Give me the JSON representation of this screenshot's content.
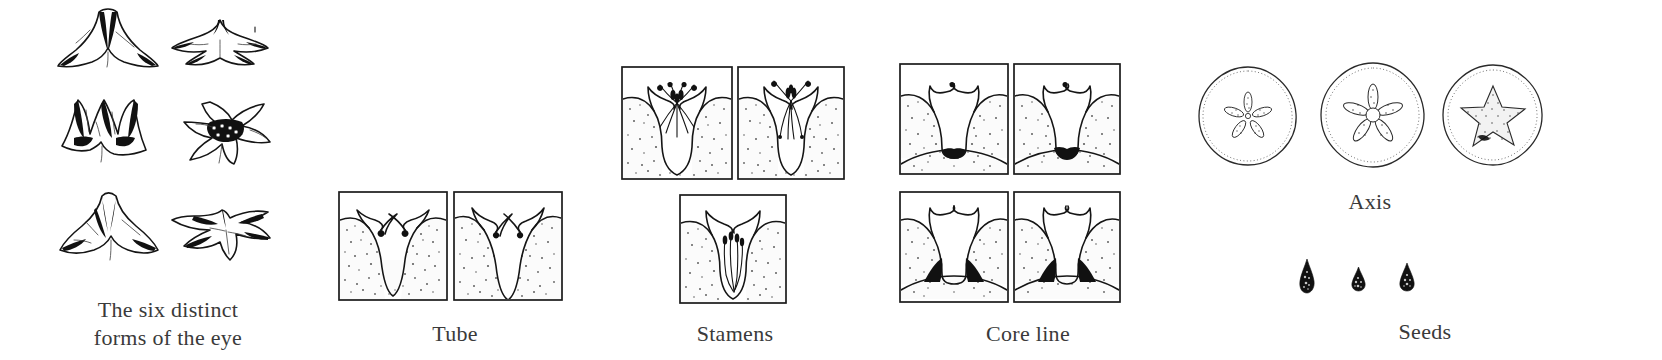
{
  "plate": {
    "title": "Flower morphology comparison plate",
    "background": "#ffffff",
    "ink_color": "#151515",
    "width": 1662,
    "height": 360
  },
  "groups": [
    {
      "id": "eye-forms",
      "caption": "The six distinct\nforms of the eye",
      "caption_x": 68,
      "caption_y": 296,
      "caption_width": 200,
      "figure_kind": "flower-sketch",
      "count": 6,
      "items": [
        {
          "label": "eye-form-1",
          "x": 52,
          "y": 6,
          "w": 110,
          "h": 70,
          "view": "side",
          "variant": "flared-trumpet"
        },
        {
          "label": "eye-form-2",
          "x": 168,
          "y": 14,
          "w": 105,
          "h": 58,
          "view": "front",
          "variant": "flat-spread"
        },
        {
          "label": "eye-form-3",
          "x": 56,
          "y": 88,
          "w": 106,
          "h": 76,
          "view": "side",
          "variant": "spiked-dark-throat"
        },
        {
          "label": "eye-form-4",
          "x": 172,
          "y": 100,
          "w": 104,
          "h": 64,
          "view": "front",
          "variant": "dark-center-rosette"
        },
        {
          "label": "eye-form-5",
          "x": 56,
          "y": 192,
          "w": 108,
          "h": 72,
          "view": "side",
          "variant": "folded-cone"
        },
        {
          "label": "eye-form-6",
          "x": 170,
          "y": 200,
          "w": 106,
          "h": 62,
          "view": "front",
          "variant": "narrow-rays"
        }
      ]
    },
    {
      "id": "tube",
      "caption": "Tube",
      "caption_x": 380,
      "caption_y": 320,
      "caption_width": 150,
      "figure_kind": "section-panel",
      "count": 2,
      "items": [
        {
          "label": "tube-panel-1",
          "x": 337,
          "y": 190,
          "w": 110,
          "h": 110,
          "variant": "narrow-v",
          "core": "none"
        },
        {
          "label": "tube-panel-2",
          "x": 452,
          "y": 190,
          "w": 110,
          "h": 110,
          "variant": "deeper-v",
          "core": "none"
        }
      ]
    },
    {
      "id": "stamens",
      "caption": "Stamens",
      "caption_x": 655,
      "caption_y": 320,
      "caption_width": 160,
      "figure_kind": "section-panel",
      "count": 3,
      "items": [
        {
          "label": "stamens-panel-1",
          "x": 620,
          "y": 65,
          "w": 112,
          "h": 115,
          "variant": "exserted-spray",
          "core": "none"
        },
        {
          "label": "stamens-panel-2",
          "x": 736,
          "y": 65,
          "w": 108,
          "h": 115,
          "variant": "tight-column",
          "core": "none"
        },
        {
          "label": "stamens-panel-3",
          "x": 678,
          "y": 193,
          "w": 108,
          "h": 110,
          "variant": "included-short",
          "core": "none"
        }
      ]
    },
    {
      "id": "core-line",
      "caption": "Core line",
      "caption_x": 948,
      "caption_y": 320,
      "caption_width": 160,
      "figure_kind": "section-panel",
      "count": 4,
      "items": [
        {
          "label": "core-panel-1",
          "x": 898,
          "y": 62,
          "w": 110,
          "h": 112,
          "variant": "wide-throat",
          "core": "basal-wedge"
        },
        {
          "label": "core-panel-2",
          "x": 1012,
          "y": 62,
          "w": 108,
          "h": 112,
          "variant": "wide-throat",
          "core": "basal-wedge"
        },
        {
          "label": "core-panel-3",
          "x": 898,
          "y": 190,
          "w": 110,
          "h": 112,
          "variant": "flanked",
          "core": "side-wedges"
        },
        {
          "label": "core-panel-4",
          "x": 1012,
          "y": 190,
          "w": 108,
          "h": 112,
          "variant": "flanked",
          "core": "side-wedges"
        }
      ]
    },
    {
      "id": "axis",
      "caption": "Axis",
      "caption_x": 1285,
      "caption_y": 188,
      "caption_width": 170,
      "figure_kind": "cross-section-circle",
      "count": 3,
      "items": [
        {
          "label": "axis-circle-1",
          "x": 1196,
          "y": 64,
          "w": 102,
          "h": 102,
          "star": "thin-rays",
          "rays": 5
        },
        {
          "label": "axis-circle-2",
          "x": 1318,
          "y": 60,
          "w": 108,
          "h": 108,
          "star": "medium-rays",
          "rays": 5
        },
        {
          "label": "axis-circle-3",
          "x": 1440,
          "y": 62,
          "w": 104,
          "h": 104,
          "star": "solid-star",
          "rays": 5
        }
      ]
    },
    {
      "id": "seeds",
      "caption": "Seeds",
      "caption_x": 1340,
      "caption_y": 318,
      "caption_width": 170,
      "figure_kind": "seed",
      "count": 3,
      "items": [
        {
          "label": "seed-1",
          "x": 1297,
          "y": 258,
          "w": 18,
          "h": 34,
          "shape": "elongated-teardrop"
        },
        {
          "label": "seed-2",
          "x": 1350,
          "y": 266,
          "w": 15,
          "h": 24,
          "shape": "small-ovate"
        },
        {
          "label": "seed-3",
          "x": 1398,
          "y": 262,
          "w": 16,
          "h": 28,
          "shape": "teardrop"
        }
      ]
    }
  ]
}
